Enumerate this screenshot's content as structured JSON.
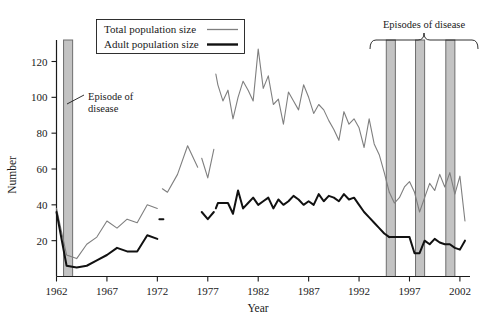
{
  "chart_data": {
    "type": "line",
    "title": "",
    "xlabel": "Year",
    "ylabel": "Number",
    "xlim": [
      1962,
      2003
    ],
    "ylim": [
      0,
      132
    ],
    "grid": false,
    "legend_position": "top-left",
    "x_ticks": [
      1962,
      1967,
      1972,
      1977,
      1982,
      1987,
      1992,
      1997,
      2002
    ],
    "y_ticks": [
      20,
      40,
      60,
      80,
      100,
      120
    ],
    "series": [
      {
        "name": "Total population size",
        "color": "#7f7f7f",
        "width": 1.1,
        "segments": [
          {
            "x": [
              1962,
              1963,
              1964,
              1965,
              1966,
              1967,
              1968,
              1969,
              1970,
              1971,
              1972
            ],
            "y": [
              38,
              12,
              10,
              18,
              22,
              31,
              27,
              32,
              30,
              40,
              38
            ]
          },
          {
            "x": [
              1972.5,
              1973,
              1974,
              1975,
              1976
            ],
            "y": [
              49,
              47,
              57,
              73,
              61
            ]
          },
          {
            "x": [
              1976.4,
              1977,
              1977.6
            ],
            "y": [
              66,
              55,
              71
            ]
          },
          {
            "x": [
              1977.8,
              1978,
              1978.5,
              1979,
              1979.5,
              1980,
              1980.5,
              1981,
              1981.5,
              1982,
              1982.5,
              1983,
              1983.5,
              1984,
              1984.5,
              1985,
              1985.5,
              1986,
              1986.5,
              1987,
              1987.5,
              1988,
              1988.5,
              1989,
              1989.5,
              1990,
              1990.5,
              1991,
              1991.5,
              1992,
              1992.5,
              1993,
              1993.5,
              1994,
              1994.5,
              1995
            ],
            "y": [
              113,
              107,
              98,
              104,
              88,
              100,
              109,
              104,
              98,
              127,
              105,
              112,
              96,
              99,
              85,
              103,
              98,
              93,
              107,
              100,
              91,
              96,
              93,
              87,
              82,
              76,
              92,
              85,
              88,
              83,
              72,
              88,
              74,
              68,
              58,
              47
            ]
          },
          {
            "x": [
              1995,
              1995.5,
              1996,
              1996.5,
              1997,
              1997.5,
              1998,
              1998.5,
              1999,
              1999.5,
              2000,
              2000.5,
              2001,
              2001.5,
              2002,
              2002.5
            ],
            "y": [
              47,
              41,
              44,
              50,
              53,
              47,
              36,
              44,
              52,
              48,
              57,
              50,
              58,
              46,
              56,
              31
            ]
          }
        ]
      },
      {
        "name": "Adult population size",
        "color": "#111111",
        "width": 2.0,
        "segments": [
          {
            "x": [
              1962,
              1963,
              1964,
              1965,
              1966,
              1967,
              1968,
              1969,
              1970,
              1971,
              1972
            ],
            "y": [
              36,
              6,
              5,
              6,
              9,
              12,
              16,
              14,
              14,
              23,
              21
            ]
          },
          {
            "x": [
              1972.2,
              1972.6
            ],
            "y": [
              32,
              32
            ]
          },
          {
            "x": [
              1976.4,
              1977,
              1977.6
            ],
            "y": [
              36,
              32,
              36
            ]
          },
          {
            "x": [
              1977.8,
              1978,
              1978.5,
              1979,
              1979.5,
              1980,
              1980.5,
              1981,
              1981.5,
              1982,
              1982.5,
              1983,
              1983.5,
              1984,
              1984.5,
              1985,
              1985.5,
              1986,
              1986.5,
              1987,
              1987.5,
              1988,
              1988.5,
              1989,
              1989.5,
              1990,
              1990.5,
              1991,
              1991.5,
              1992,
              1992.5,
              1993,
              1993.5,
              1994,
              1994.5,
              1995
            ],
            "y": [
              38,
              41,
              41,
              41,
              35,
              48,
              38,
              41,
              44,
              40,
              42,
              44,
              38,
              43,
              40,
              42,
              45,
              43,
              40,
              42,
              40,
              46,
              42,
              45,
              44,
              42,
              46,
              43,
              44,
              40,
              36,
              33,
              30,
              27,
              24,
              22
            ]
          },
          {
            "x": [
              1995,
              1995.5,
              1996,
              1996.5,
              1997,
              1997.5,
              1998,
              1998.5,
              1999,
              1999.5,
              2000,
              2000.5,
              2001,
              2001.5,
              2002,
              2002.5
            ],
            "y": [
              22,
              22,
              22,
              22,
              22,
              13,
              13,
              20,
              18,
              21,
              19,
              18,
              18,
              16,
              15,
              20
            ]
          }
        ]
      }
    ],
    "episode_bars": [
      {
        "start": 1962.7,
        "end": 1963.6,
        "top": 132
      },
      {
        "start": 1994.7,
        "end": 1995.6,
        "top": 132
      },
      {
        "start": 1997.6,
        "end": 1998.5,
        "top": 132
      },
      {
        "start": 2000.6,
        "end": 2001.5,
        "top": 132
      }
    ],
    "annotations": [
      {
        "name": "episode-of-disease-label",
        "text_line1": "Episode of",
        "text_line2": "disease"
      },
      {
        "name": "episodes-of-disease-label",
        "text": "Episodes of disease"
      }
    ]
  },
  "legend": {
    "items": [
      {
        "label": "Total population size"
      },
      {
        "label": "Adult population size"
      }
    ]
  }
}
